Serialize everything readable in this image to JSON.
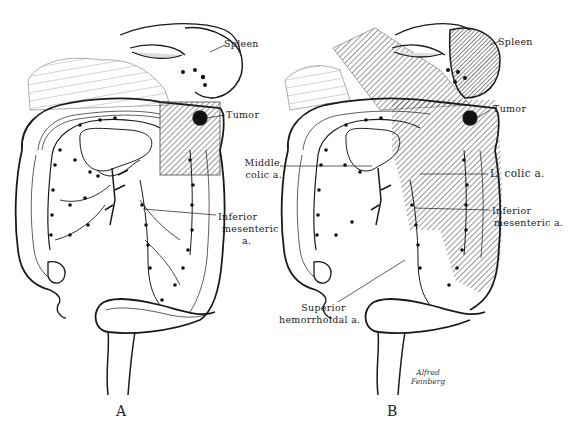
{
  "figure": {
    "panels": [
      {
        "id": "A",
        "letter": "A",
        "labels": {
          "spleen": "Spleen",
          "tumor": "Tumor",
          "inferior_mesenteric_1": "Inferior",
          "inferior_mesenteric_2": "mesenteric",
          "inferior_mesenteric_3": "a."
        }
      },
      {
        "id": "B",
        "letter": "B",
        "labels": {
          "spleen": "Spleen",
          "tumor": "Tumor",
          "middle_colic_1": "Middle",
          "middle_colic_2": "colic a.",
          "left_colic": "L. colic a.",
          "inferior_mesenteric_1": "Inferior",
          "inferior_mesenteric_2": "mesenteric a.",
          "superior_hemorrhoidal_1": "Superior",
          "superior_hemorrhoidal_2": "hemorrhoidal a."
        }
      }
    ],
    "signature": {
      "line1": "Alfred",
      "line2": "Feinberg"
    },
    "colors": {
      "ink": "#1a1a1a",
      "paper": "#ffffff",
      "hatch": "#333333"
    }
  }
}
